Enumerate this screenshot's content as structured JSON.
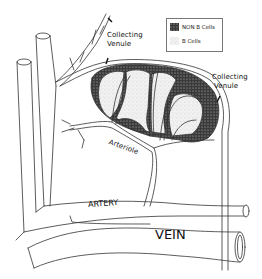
{
  "figure": {
    "type": "anatomical-diagram"
  },
  "legend": {
    "items": [
      {
        "label": "NON B Cells",
        "swatch": "dark-stipple",
        "color": "#2a2a2a"
      },
      {
        "label": "B Cells",
        "swatch": "light-stipple",
        "color": "#e6e6e6"
      }
    ]
  },
  "labels": {
    "collecting_venule_top": [
      "Collecting",
      "Venule"
    ],
    "collecting_venule_right": [
      "Collecting",
      "Venule"
    ],
    "arteriole": "Arteriole",
    "artery": "ARTERY",
    "vein": "VEIN"
  },
  "colors": {
    "line": "#333333",
    "non_b_cells": "#2a2a2a",
    "b_cells": "#e8e8e8",
    "background": "#ffffff"
  }
}
